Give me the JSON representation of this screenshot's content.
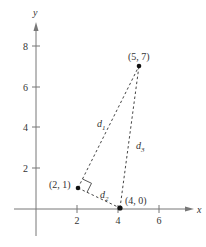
{
  "figure": {
    "axes": {
      "x_label": "x",
      "y_label": "y",
      "x_ticks": [
        "2",
        "4",
        "6"
      ],
      "y_ticks": [
        "2",
        "4",
        "6",
        "8"
      ]
    },
    "points": [
      {
        "label": "(2, 1)",
        "x": 2,
        "y": 1
      },
      {
        "label": "(4, 0)",
        "x": 4,
        "y": 0
      },
      {
        "label": "(5, 7)",
        "x": 5,
        "y": 7
      }
    ],
    "segments": [
      {
        "name": "d",
        "sub": "1",
        "from": "(2, 1)",
        "to": "(5, 7)"
      },
      {
        "name": "d",
        "sub": "2",
        "from": "(2, 1)",
        "to": "(4, 0)"
      },
      {
        "name": "d",
        "sub": "3",
        "from": "(4, 0)",
        "to": "(5, 7)"
      }
    ],
    "right_angle_at": "(2, 1)"
  }
}
